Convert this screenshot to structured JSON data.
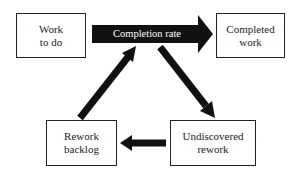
{
  "diagram": {
    "nodes": [
      {
        "id": "work-to-do",
        "label_line1": "Work",
        "label_line2": "to do"
      },
      {
        "id": "completed-work",
        "label_line1": "Completed",
        "label_line2": "work"
      },
      {
        "id": "undiscovered-rework",
        "label_line1": "Undiscovered",
        "label_line2": "rework"
      },
      {
        "id": "rework-backlog",
        "label_line1": "Rework",
        "label_line2": "backlog"
      }
    ],
    "edges": [
      {
        "from": "work-to-do",
        "to": "completed-work",
        "label": "Completion rate"
      },
      {
        "from": "completion-rate",
        "to": "undiscovered-rework",
        "label": ""
      },
      {
        "from": "undiscovered-rework",
        "to": "rework-backlog",
        "label": ""
      },
      {
        "from": "rework-backlog",
        "to": "completion-rate",
        "label": ""
      }
    ],
    "colors": {
      "arrow": "#111111",
      "box_border": "#222222",
      "text": "#222222"
    }
  }
}
